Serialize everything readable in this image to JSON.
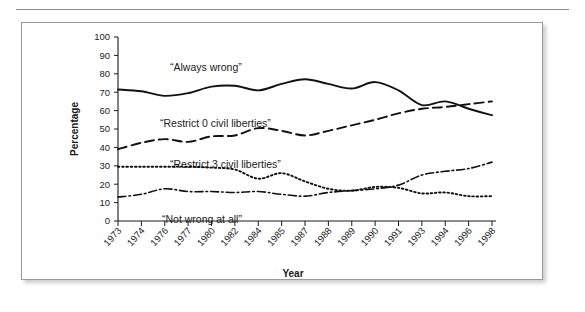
{
  "page": {
    "background_color": "#ffffff",
    "rule_color": "#8b8b8b",
    "panel_border_color": "#9a9a9a"
  },
  "chart_data": {
    "type": "line",
    "title": "",
    "subtitle": "",
    "xlabel": "Year",
    "ylabel": "Percentage",
    "ylim": [
      0,
      100
    ],
    "ytick_step": 10,
    "yticks": [
      0,
      10,
      20,
      30,
      40,
      50,
      60,
      70,
      80,
      90,
      100
    ],
    "grid": false,
    "legend_position": "inline-annotations",
    "categories": [
      "1973",
      "1974",
      "1976",
      "1977",
      "1980",
      "1982",
      "1984",
      "1985",
      "1987",
      "1988",
      "1989",
      "1990",
      "1991",
      "1993",
      "1994",
      "1996",
      "1998"
    ],
    "series": [
      {
        "name": "“Always wrong”",
        "line_style": "solid",
        "color": "#111111",
        "values": [
          71.5,
          70.5,
          68.0,
          69.5,
          73.0,
          73.5,
          71.0,
          74.5,
          77.0,
          74.5,
          72.0,
          75.5,
          71.0,
          63.0,
          65.0,
          61.0,
          57.5
        ]
      },
      {
        "name": "“Restrict 0 civil liberties”",
        "line_style": "dashed",
        "color": "#111111",
        "values": [
          39.0,
          42.5,
          44.5,
          43.0,
          46.0,
          46.5,
          50.5,
          49.0,
          46.5,
          49.0,
          52.0,
          55.0,
          58.5,
          61.0,
          62.0,
          63.5,
          65.0
        ]
      },
      {
        "name": "“Restrict 3 civil liberties”",
        "line_style": "dotted",
        "color": "#111111",
        "values": [
          29.5,
          29.5,
          29.5,
          29.5,
          29.0,
          28.0,
          23.0,
          26.0,
          21.5,
          17.5,
          16.5,
          18.5,
          18.0,
          15.0,
          15.5,
          13.5,
          13.5
        ]
      },
      {
        "name": "“Not wrong at all”",
        "line_style": "dashdot",
        "color": "#111111",
        "values": [
          13.0,
          14.5,
          17.5,
          16.0,
          16.0,
          15.5,
          16.0,
          14.5,
          13.5,
          15.5,
          16.5,
          17.5,
          19.5,
          25.0,
          27.0,
          28.5,
          32.0
        ]
      }
    ],
    "annotations": [
      {
        "text": "“Always wrong”",
        "x_px": 148,
        "y_px": 48
      },
      {
        "text": "“Restrict 0 civil liberties”",
        "x_px": 138,
        "y_px": 104
      },
      {
        "text": "“Restrict 3 civil liberties”",
        "x_px": 148,
        "y_px": 145
      },
      {
        "text": "“Not wrong at all”",
        "x_px": 140,
        "y_px": 200
      }
    ]
  }
}
